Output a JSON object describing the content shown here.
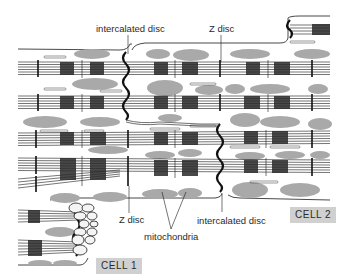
{
  "labels": {
    "intercalated_disc_top": "intercalated disc",
    "z_disc_top": "Z disc",
    "z_disc_bottom": "Z disc",
    "mitochondria": "mitochondria",
    "intercalated_disc_bottom": "intercalated disc",
    "cell1": "CELL 1",
    "cell2": "CELL 2"
  },
  "colors": {
    "line": "#1a1a1a",
    "mitochondria": "#a9a9a9",
    "label_box": "#d0d0d0",
    "background": "#ffffff"
  }
}
